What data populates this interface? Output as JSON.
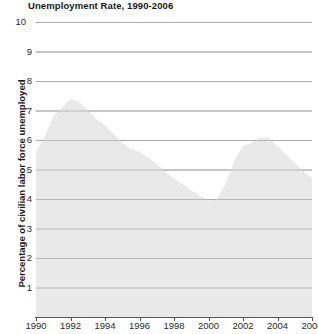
{
  "chart_data": {
    "type": "area",
    "title": "Unemployment Rate, 1990-2006",
    "xlabel": "",
    "ylabel": "Percentage of civilian labor force unemployed",
    "xlim": [
      1990,
      2006
    ],
    "ylim": [
      0,
      10
    ],
    "grid": true,
    "legend": "none",
    "fill_color": "#e9e9e9",
    "grid_color": "#a9a9a9",
    "axis_color": "#555555",
    "text_color": "#1a1a1a",
    "y_ticks": [
      10,
      9,
      8,
      7,
      6,
      5,
      4,
      3,
      2,
      1
    ],
    "x_ticks": [
      1990,
      1992,
      1994,
      1996,
      1998,
      2000,
      2002,
      2004,
      2006
    ],
    "x": [
      1990,
      1990.5,
      1991,
      1991.5,
      1992,
      1992.5,
      1993,
      1993.5,
      1994,
      1994.5,
      1995,
      1995.5,
      1996,
      1996.5,
      1997,
      1997.5,
      1998,
      1998.5,
      1999,
      1999.5,
      2000,
      2000.5,
      2001,
      2001.5,
      2002,
      2002.5,
      2003,
      2003.5,
      2004,
      2004.5,
      2005,
      2005.5,
      2006
    ],
    "values": [
      5.6,
      6.1,
      6.8,
      7.1,
      7.4,
      7.3,
      7.0,
      6.7,
      6.5,
      6.2,
      5.9,
      5.7,
      5.6,
      5.4,
      5.2,
      4.9,
      4.7,
      4.5,
      4.3,
      4.1,
      3.95,
      4.0,
      4.5,
      5.3,
      5.8,
      5.9,
      6.1,
      6.05,
      5.8,
      5.5,
      5.2,
      4.95,
      4.7
    ]
  }
}
